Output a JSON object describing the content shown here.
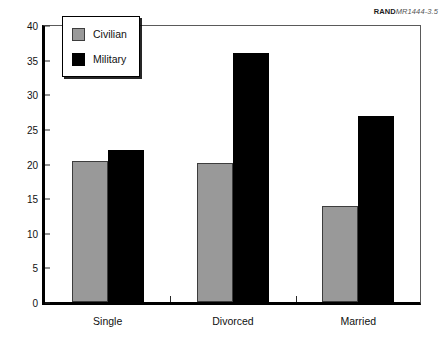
{
  "source_credit": {
    "brand": "RAND",
    "document": "MR1444-3.5"
  },
  "legend": {
    "position": "upper-left-inside",
    "entries": [
      {
        "label": "Civilian",
        "color": "#999999",
        "swatch": "civilian-swatch"
      },
      {
        "label": "Military",
        "color": "#000000",
        "swatch": "military-swatch"
      }
    ]
  },
  "axes": {
    "y_ticks": [
      "0",
      "5",
      "10",
      "15",
      "20",
      "25",
      "30",
      "35",
      "40"
    ],
    "x_labels": [
      "Single",
      "Divorced",
      "Married"
    ]
  },
  "chart_data": {
    "type": "bar",
    "title": "",
    "subtitle": "",
    "xlabel": "",
    "ylabel": "",
    "ylim": [
      0,
      40
    ],
    "ytick_step": 5,
    "grid": false,
    "legend_position": "upper left (inside plot)",
    "categories": [
      "Single",
      "Divorced",
      "Married"
    ],
    "series": [
      {
        "name": "Civilian",
        "color": "#999999",
        "values": [
          20.3,
          20.1,
          13.8
        ]
      },
      {
        "name": "Military",
        "color": "#000000",
        "values": [
          21.9,
          36.0,
          26.8
        ]
      }
    ],
    "annotations": [
      "RANDMR1444-3.5"
    ]
  }
}
